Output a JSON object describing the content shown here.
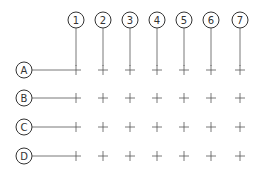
{
  "diagram": {
    "type": "structural-grid",
    "column_labels": [
      "1",
      "2",
      "3",
      "4",
      "5",
      "6",
      "7"
    ],
    "row_labels": [
      "A",
      "B",
      "C",
      "D"
    ],
    "column_x": [
      76,
      103,
      130,
      157,
      184,
      211,
      240
    ],
    "row_y": [
      70,
      98,
      127,
      156
    ],
    "line_color": "#555555",
    "bubble_color": "#333333"
  }
}
